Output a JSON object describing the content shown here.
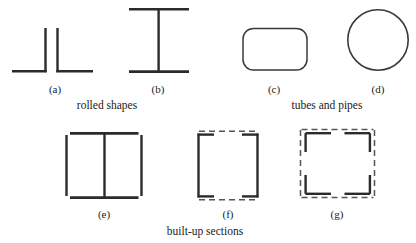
{
  "figure": {
    "background_color": "#ffffff",
    "stroke_color": "#2b2b2b",
    "thin_stroke_color": "#3a3a3a",
    "dashed_stroke_color": "#555555",
    "shapes": [
      {
        "id": "a",
        "label": "(a)",
        "name": "back-to-back-angles",
        "description": "two rolled angles placed back to back",
        "label_x": 55,
        "label_y": 84
      },
      {
        "id": "b",
        "label": "(b)",
        "name": "i-beam-wide-flange",
        "description": "rolled wide flange I shape",
        "label_x": 158,
        "label_y": 84
      },
      {
        "id": "c",
        "label": "(c)",
        "name": "rectangular-tube",
        "description": "rectangular tube with rounded corners",
        "label_x": 274,
        "label_y": 84
      },
      {
        "id": "d",
        "label": "(d)",
        "name": "round-pipe",
        "description": "round pipe cross section",
        "label_x": 378,
        "label_y": 84
      },
      {
        "id": "e",
        "label": "(e)",
        "name": "built-up-box-with-web",
        "description": "built-up box of plates with a central web plate",
        "label_x": 104,
        "label_y": 209
      },
      {
        "id": "f",
        "label": "(f)",
        "name": "laced-channels",
        "description": "two channels laced together top and bottom",
        "label_x": 228,
        "label_y": 209
      },
      {
        "id": "g",
        "label": "(g)",
        "name": "laced-corner-angles",
        "description": "four corner angles laced on all four sides",
        "label_x": 337,
        "label_y": 209
      }
    ],
    "group_captions": [
      {
        "id": "rolled",
        "text": "rolled shapes",
        "name": "caption-rolled-shapes",
        "x": 107,
        "y": 100
      },
      {
        "id": "tubes",
        "text": "tubes and pipes",
        "name": "caption-tubes-and-pipes",
        "x": 327,
        "y": 100
      },
      {
        "id": "builtup",
        "text": "built-up sections",
        "name": "caption-built-up-sections",
        "x": 205,
        "y": 226
      }
    ]
  }
}
